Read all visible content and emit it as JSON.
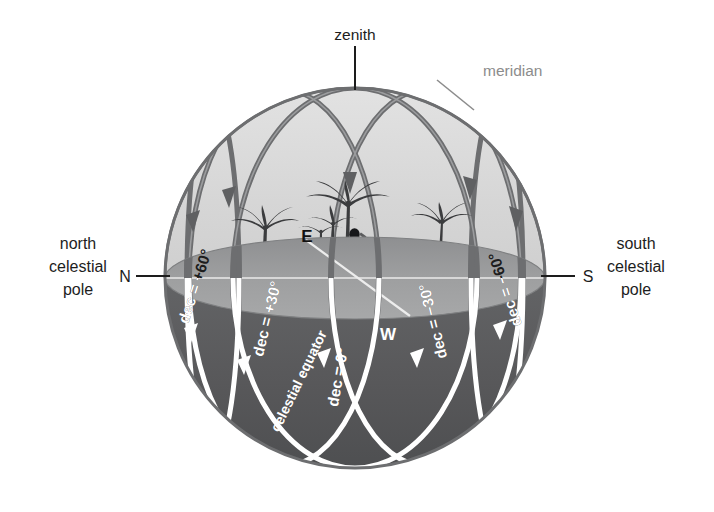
{
  "figure": {
    "title_labels": {
      "zenith": "zenith",
      "meridian": "meridian"
    },
    "poles": {
      "north": {
        "line1": "north",
        "line2": "celestial",
        "line3": "pole",
        "marker": "N"
      },
      "south": {
        "line1": "south",
        "line2": "celestial",
        "line3": "pole",
        "marker": "S"
      }
    },
    "cardinal_points": {
      "east": "E",
      "west": "W"
    },
    "declination_circles": [
      {
        "id": "dec-plus-60",
        "label": "dec = +60°",
        "value": 60
      },
      {
        "id": "dec-plus-30",
        "label": "dec = +30°",
        "value": 30
      },
      {
        "id": "dec-zero",
        "label": "dec = 0°",
        "value": 0,
        "alt_label": "celestial equator"
      },
      {
        "id": "dec-minus-30",
        "label": "dec = −30°",
        "value": -30
      },
      {
        "id": "dec-minus-60",
        "label": "dec = −60°",
        "value": -60
      }
    ],
    "celestial_equator_label": "celestial equator",
    "colors": {
      "background": "#ffffff",
      "sphere_upper": "#d8d8d8",
      "sphere_lower": "#58595b",
      "horizon_plane": "#9a9a9a",
      "arc_dark": "#6d6e70",
      "arc_white": "#ffffff",
      "outline": "#6d6e70",
      "text_dark": "#1d1d1d",
      "text_gray": "#8c8c8c",
      "text_white": "#ffffff"
    }
  }
}
